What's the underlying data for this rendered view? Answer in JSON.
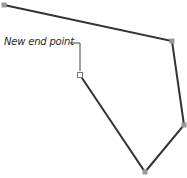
{
  "diagram": {
    "label": "New end point",
    "path_points": [
      [
        4,
        5
      ],
      [
        172,
        41
      ],
      [
        184,
        125
      ],
      [
        145,
        172
      ],
      [
        80,
        75
      ]
    ],
    "end_point": [
      80,
      75
    ],
    "colors": {
      "stroke": "#333333",
      "anchor": "#999999",
      "end_anchor_fill": "#ffffff",
      "leader": "#444444"
    }
  }
}
